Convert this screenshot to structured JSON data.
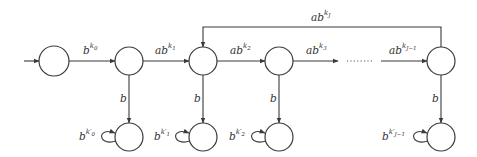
{
  "diagram": {
    "type": "automaton",
    "colors": {
      "stroke": "#3a3a3a",
      "background": "#ffffff",
      "text": "#333333"
    },
    "nodes": [
      {
        "id": "q0",
        "x": 54,
        "y": 61,
        "r": 15,
        "initial": true
      },
      {
        "id": "q1",
        "x": 129,
        "y": 61,
        "r": 14
      },
      {
        "id": "q2",
        "x": 203,
        "y": 61,
        "r": 14
      },
      {
        "id": "q3",
        "x": 279,
        "y": 61,
        "r": 14
      },
      {
        "id": "qJ1",
        "x": 441,
        "y": 61,
        "r": 14
      },
      {
        "id": "s0",
        "x": 129,
        "y": 137,
        "r": 14
      },
      {
        "id": "s1",
        "x": 203,
        "y": 137,
        "r": 14
      },
      {
        "id": "s2",
        "x": 279,
        "y": 137,
        "r": 14
      },
      {
        "id": "sJ1",
        "x": 441,
        "y": 137,
        "r": 14
      }
    ],
    "edge_labels": {
      "q0_q1": {
        "base": "b",
        "sup": "k",
        "subsup": "0"
      },
      "q1_q2": {
        "base": "ab",
        "sup": "k",
        "subsup": "1"
      },
      "q2_q3": {
        "base": "ab",
        "sup": "k",
        "subsup": "2"
      },
      "q3_dots": {
        "base": "ab",
        "sup": "k",
        "subsup": "3"
      },
      "dots_qJ1": {
        "base": "ab",
        "sup": "k",
        "subsup": "J−1"
      },
      "qJ1_q2": {
        "base": "ab",
        "sup": "k",
        "subsup": "J"
      },
      "down_1": {
        "base": "b"
      },
      "down_2": {
        "base": "b"
      },
      "down_3": {
        "base": "b"
      },
      "down_J1": {
        "base": "b"
      },
      "loop_0": {
        "base": "b",
        "sup": "k′",
        "subsup": "0"
      },
      "loop_1": {
        "base": "b",
        "sup": "k′",
        "subsup": "1"
      },
      "loop_2": {
        "base": "b",
        "sup": "k′",
        "subsup": "2"
      },
      "loop_J1": {
        "base": "b",
        "sup": "k′",
        "subsup": "J−1"
      }
    },
    "ellipsis": "……"
  }
}
